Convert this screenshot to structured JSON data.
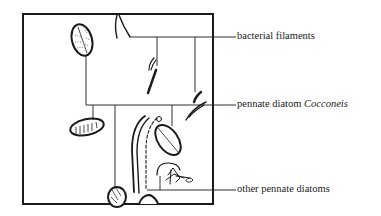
{
  "diagram": {
    "type": "labeled-illustration",
    "labels": [
      {
        "id": "bacterial",
        "text": "bacterial filaments",
        "italic": ""
      },
      {
        "id": "cocconeis",
        "text": "pennate diatom ",
        "italic": "Cocconeis"
      },
      {
        "id": "other",
        "text": "other pennate diatoms",
        "italic": ""
      }
    ],
    "colors": {
      "ink": "#1a1a1a",
      "background": "#ffffff"
    }
  }
}
